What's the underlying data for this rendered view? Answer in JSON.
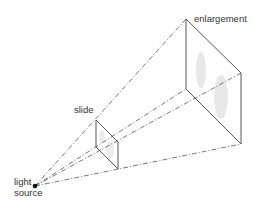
{
  "diagram": {
    "labels": {
      "enlargement": "enlargement",
      "slide": "slide",
      "light_line1": "light",
      "light_line2": "source"
    },
    "colors": {
      "line": "#444444",
      "dash": "#555555",
      "image": "#e6e6e6"
    }
  }
}
